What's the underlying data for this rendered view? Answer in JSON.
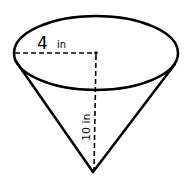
{
  "diagram": {
    "shape": "cone",
    "radius_label": "4",
    "radius_unit": "in",
    "height_label": "10 in",
    "stroke_color": "#000000",
    "background": "#ffffff"
  }
}
